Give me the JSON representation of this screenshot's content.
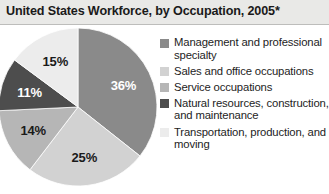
{
  "title": "United States Workforce, by Occupation, 2005*",
  "chart_data": {
    "type": "pie",
    "title": "United States Workforce, by Occupation, 2005*",
    "xlabel": "",
    "ylabel": "",
    "legend_position": "right",
    "grid": false,
    "start_angle_deg": 0,
    "direction": "clockwise",
    "categories": [
      "Management and professional specialty",
      "Sales and office occupations",
      "Service occupations",
      "Natural resources, construction, and maintenance",
      "Transportation, production, and moving"
    ],
    "values": [
      36,
      25,
      14,
      11,
      15
    ],
    "value_labels": [
      "36%",
      "25%",
      "14%",
      "11%",
      "15%"
    ],
    "colors": [
      "#8a8a8a",
      "#d2d2d2",
      "#b6b6b6",
      "#4d4d4d",
      "#ececec"
    ],
    "label_colors": [
      "#ffffff",
      "#1a1a1a",
      "#1a1a1a",
      "#ffffff",
      "#1a1a1a"
    ]
  },
  "legend": {
    "items": [
      {
        "label": "Management and professional specialty",
        "color": "#8a8a8a",
        "value_label": "36%"
      },
      {
        "label": "Sales and office occupations",
        "color": "#d2d2d2",
        "value_label": "25%"
      },
      {
        "label": "Service occupations",
        "color": "#b6b6b6",
        "value_label": "14%"
      },
      {
        "label": "Natural resources, construction, and maintenance",
        "color": "#4d4d4d",
        "value_label": "11%"
      },
      {
        "label": "Transportation, production, and moving",
        "color": "#ececec",
        "value_label": "15%"
      }
    ]
  }
}
